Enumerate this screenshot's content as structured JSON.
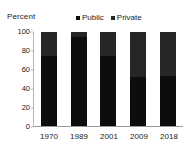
{
  "chart_data": {
    "type": "bar",
    "subtype": "stacked-100-percent",
    "title": "",
    "xlabel": "",
    "ylabel": "Percent",
    "ylim": [
      0,
      100
    ],
    "yticks": [
      0,
      20,
      40,
      60,
      80,
      100
    ],
    "grid": false,
    "legend_position": "top-center",
    "categories": [
      "1970",
      "1989",
      "2001",
      "2009",
      "2018"
    ],
    "series": [
      {
        "name": "Public",
        "color": "#0d0d0d",
        "values": [
          74,
          95,
          74,
          52,
          53
        ]
      },
      {
        "name": "Private",
        "color": "#262626",
        "values": [
          26,
          5,
          26,
          48,
          47
        ]
      }
    ]
  },
  "axis": {
    "y_title": "Percent",
    "y_tick_labels": [
      "100",
      "80",
      "60",
      "40",
      "20",
      "0"
    ],
    "x_tick_labels": [
      "1970",
      "1989",
      "2001",
      "2009",
      "2018"
    ]
  },
  "legend": {
    "items": [
      {
        "label": "Public",
        "marker": "square-marker",
        "color": "#0d0d0d"
      },
      {
        "label": "Private",
        "marker": "square-marker",
        "color": "#262626"
      }
    ]
  },
  "colors": {
    "background": "#ffffff",
    "text": "#1a1a1a",
    "axis": "#b7b7b7",
    "public": "#0d0d0d",
    "private": "#262626"
  }
}
